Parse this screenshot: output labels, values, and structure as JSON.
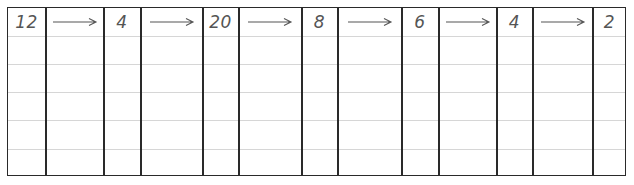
{
  "worksheet": {
    "sequence": [
      {
        "type": "number",
        "value": "12"
      },
      {
        "type": "arrow"
      },
      {
        "type": "number",
        "value": "4"
      },
      {
        "type": "arrow"
      },
      {
        "type": "number",
        "value": "20"
      },
      {
        "type": "arrow"
      },
      {
        "type": "number",
        "value": "8"
      },
      {
        "type": "arrow"
      },
      {
        "type": "number",
        "value": "6"
      },
      {
        "type": "arrow"
      },
      {
        "type": "number",
        "value": "4"
      },
      {
        "type": "arrow"
      },
      {
        "type": "number",
        "value": "2"
      }
    ],
    "empty_rows": 5
  }
}
